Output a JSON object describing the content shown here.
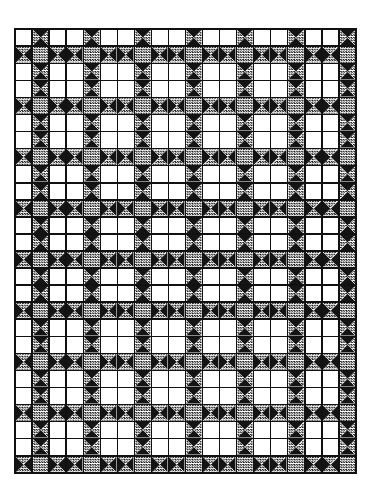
{
  "page": {
    "width": 371,
    "height": 498,
    "background": "#ffffff"
  },
  "quilt": {
    "name": "ohio-star-quilt-layout",
    "grid_origin_x": 14,
    "grid_origin_y": 28,
    "grid_width": 339,
    "grid_height": 442,
    "cell_size": 16.5,
    "columns": 20,
    "rows": 26,
    "gap": 1.6,
    "border_width": 2.6,
    "star_period": 3,
    "star_center_col": 1,
    "star_center_row": 1,
    "colors": {
      "background": "#ffffff",
      "line": "#111111",
      "dark": "#141414",
      "light": "#ffffff",
      "medium_base": "#ffffff",
      "medium_dot": "#1a1a1a",
      "border": "#111111"
    },
    "legend": {
      "dark_fabric": "solid black",
      "medium_fabric": "checkered gray",
      "light_fabric": "plain white"
    },
    "block": {
      "type": "ohio-star",
      "size": "3x3 units",
      "center_unit": "medium square",
      "side_units": "quarter-square-triangle hourglass (medium vertical / dark horizontal)",
      "corner_units": "light square"
    }
  }
}
